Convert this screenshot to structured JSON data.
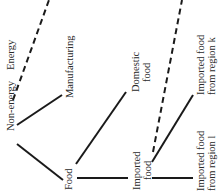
{
  "diagram": {
    "type": "tree",
    "orientation": "rotated-90",
    "colors": {
      "line": "#1a1a1a",
      "text": "#2a2a2a",
      "background": "#ffffff"
    },
    "nodes": {
      "energy": {
        "label": "Energy"
      },
      "non_energy": {
        "label": "Non-energy"
      },
      "manufacturing": {
        "label": "Manufacturing"
      },
      "food": {
        "label": "Food"
      },
      "domestic_food": {
        "line1": "Domestic",
        "line2": "food"
      },
      "imported_food": {
        "line1": "Imported",
        "line2": "food"
      },
      "imported_region_k": {
        "line1": "Imported food",
        "line2": "from region k"
      },
      "imported_region_l": {
        "line1": "Imported food",
        "line2": "from region l"
      }
    },
    "edges": [
      {
        "from": "non_energy",
        "to": "energy",
        "style": "dashed"
      },
      {
        "from": "non_energy",
        "to": "manufacturing",
        "style": "solid"
      },
      {
        "from": "non_energy",
        "to": "food",
        "style": "solid"
      },
      {
        "from": "food",
        "to": "domestic_food",
        "style": "solid"
      },
      {
        "from": "food",
        "to": "imported_food",
        "style": "solid"
      },
      {
        "from": "imported_food",
        "to": "continuation",
        "style": "dashed"
      },
      {
        "from": "imported_food",
        "to": "imported_region_k",
        "style": "solid"
      },
      {
        "from": "imported_food",
        "to": "imported_region_l",
        "style": "solid"
      }
    ]
  }
}
